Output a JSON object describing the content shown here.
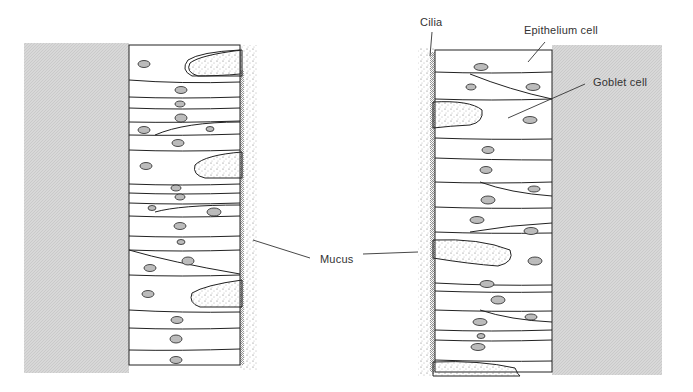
{
  "labels": {
    "cilia": "Cilia",
    "epithelium_cell": "Epithelium cell",
    "goblet_cell": "Goblet cell",
    "mucus": "Mucus"
  },
  "colors": {
    "tissue_gray": "#d4d4d4",
    "outline": "#222222",
    "nucleus_fill": "#b8b8b8"
  }
}
